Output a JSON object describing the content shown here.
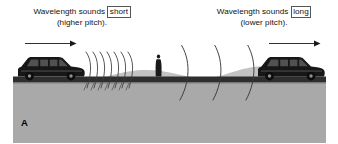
{
  "figure": {
    "panel_label": "A",
    "topic": "doppler-effect-moving-sound-source",
    "background_color": "#ffffff"
  },
  "caption_left": {
    "prefix": "Wavelength sounds",
    "boxed_word": "short",
    "line2": "(higher pitch).",
    "arrow": "right-arrow"
  },
  "caption_right": {
    "prefix": "Wavelength sounds",
    "boxed_word": "long",
    "line2": "(lower pitch).",
    "arrow": "right-arrow"
  },
  "scene": {
    "ground_color": "#a8a8a8",
    "hill_color": "#c2c2c2",
    "road_color": "#2b2b2b",
    "vehicle_color": "#1a1a1a",
    "wave_color": "#3a3a3a",
    "observer_color": "#1a1a1a",
    "left_vehicle": "station-wagon-facing-right",
    "right_vehicle": "station-wagon-facing-right",
    "observer": "standing-person-silhouette",
    "left_wave_count": 7,
    "right_wave_count": 3,
    "left_wave_spacing": "compressed",
    "right_wave_spacing": "stretched"
  }
}
